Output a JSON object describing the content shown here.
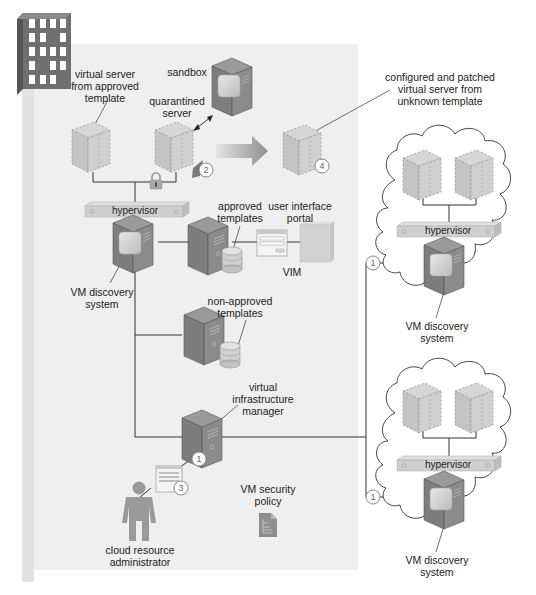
{
  "diagram": {
    "type": "cloud VM security architecture",
    "colors": {
      "panel": "#ededed",
      "panel_edge": "#dcdcdc",
      "server_dark": "#7a7a7a",
      "server_mid": "#8e8e8e",
      "virtual_server": "#c9c9c9",
      "hypervisor": "#cfcfcf",
      "line": "#333333",
      "building": "#6f6f6f",
      "arrow": "#9a9a9a"
    },
    "labels": {
      "virtual_server_approved": [
        "virtual server",
        "from approved",
        "template"
      ],
      "sandbox": "sandbox",
      "quarantined_server": [
        "quarantined",
        "server"
      ],
      "configured_patched": [
        "configured and patched",
        "virtual server from",
        "unknown template"
      ],
      "hypervisor_main": "hypervisor",
      "approved_templates": [
        "approved",
        "templates"
      ],
      "user_interface_portal": [
        "user interface",
        "portal"
      ],
      "vim_short": "VIM",
      "vm_discovery_main": [
        "VM discovery",
        "system"
      ],
      "non_approved_templates": [
        "non-approved",
        "templates"
      ],
      "virtual_infrastructure_manager": [
        "virtual",
        "infrastructure",
        "manager"
      ],
      "vm_security_policy": [
        "VM security",
        "policy"
      ],
      "cloud_resource_administrator": [
        "cloud resource",
        "administrator"
      ],
      "hypervisor_cloud_top": "hypervisor",
      "vm_discovery_cloud_top": [
        "VM discovery",
        "system"
      ],
      "hypervisor_cloud_bottom": "hypervisor",
      "vm_discovery_cloud_bottom": [
        "VM discovery",
        "system"
      ]
    },
    "step_markers": {
      "quarantine": "2",
      "configured": "4",
      "vim": "1",
      "admin_portal": "3",
      "cloud_top": "1",
      "cloud_bottom": "1"
    },
    "icons": {
      "building": "building-icon",
      "lock": "lock-icon",
      "policy": "document-icon",
      "person": "person-icon",
      "arrow": "right-arrow-icon"
    }
  }
}
